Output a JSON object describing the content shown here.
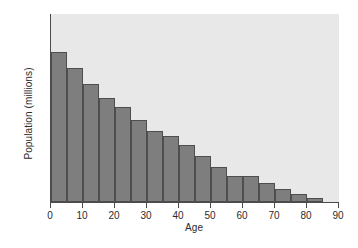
{
  "chart_data": {
    "type": "bar",
    "title": "",
    "xlabel": "Age",
    "ylabel": "Population (millions)",
    "xlim": [
      0,
      90
    ],
    "ylim": [
      0,
      100
    ],
    "grid": false,
    "legend": null,
    "bar_width_years": 5,
    "x": [
      0,
      5,
      10,
      15,
      20,
      25,
      30,
      35,
      40,
      45,
      50,
      55,
      60,
      65,
      70,
      75,
      80
    ],
    "categories": [
      "0-5",
      "5-10",
      "10-15",
      "15-20",
      "20-25",
      "25-30",
      "30-35",
      "35-40",
      "40-45",
      "45-50",
      "50-55",
      "55-60",
      "60-65",
      "65-70",
      "70-75",
      "75-80",
      "80-85"
    ],
    "values": [
      80,
      71.5,
      63,
      55.5,
      50.5,
      43.5,
      38,
      35,
      30.5,
      24.5,
      18.5,
      14,
      14,
      10,
      7,
      4,
      2
    ],
    "xticks": [
      0,
      10,
      20,
      30,
      40,
      50,
      60,
      70,
      80,
      90
    ],
    "xtick_labels": [
      "0",
      "10",
      "20",
      "30",
      "40",
      "50",
      "60",
      "70",
      "80",
      "90"
    ],
    "yticks": [
      0,
      20,
      40,
      60,
      80,
      100
    ],
    "ytick_labels": [
      "0",
      "20",
      "40",
      "60",
      "80",
      "100"
    ],
    "colors": {
      "bar_fill": "#7e7e7e",
      "bar_edge": "#4e4e4e",
      "plot_background": "#e8e8e8",
      "figure_background": "#ffffff",
      "axis": "#4a4a4a",
      "text": "#2b2b2b"
    }
  }
}
